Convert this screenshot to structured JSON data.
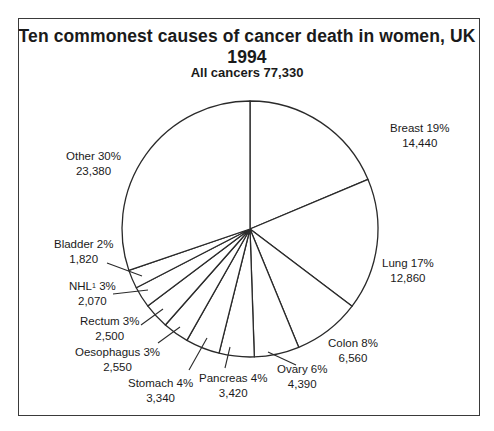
{
  "chart_data": {
    "type": "pie",
    "title": "Ten commonest causes of cancer death in women, UK 1994",
    "subtitle": "All cancers 77,330",
    "total": 77330,
    "start_angle": "12 o'clock",
    "direction": "clockwise",
    "slices": [
      {
        "name": "Breast",
        "percent": 19,
        "value": 14440,
        "label": "Breast 19%",
        "value_label": "14,440"
      },
      {
        "name": "Lung",
        "percent": 17,
        "value": 12860,
        "label": "Lung 17%",
        "value_label": "12,860"
      },
      {
        "name": "Colon",
        "percent": 8,
        "value": 6560,
        "label": "Colon 8%",
        "value_label": "6,560"
      },
      {
        "name": "Ovary",
        "percent": 6,
        "value": 4390,
        "label": "Ovary 6%",
        "value_label": "4,390"
      },
      {
        "name": "Pancreas",
        "percent": 4,
        "value": 3420,
        "label": "Pancreas 4%",
        "value_label": "3,420"
      },
      {
        "name": "Stomach",
        "percent": 4,
        "value": 3340,
        "label": "Stomach 4%",
        "value_label": "3,340"
      },
      {
        "name": "Oesophagus",
        "percent": 3,
        "value": 2550,
        "label": "Oesophagus 3%",
        "value_label": "2,550"
      },
      {
        "name": "Rectum",
        "percent": 3,
        "value": 2500,
        "label": "Rectum 3%",
        "value_label": "2,500"
      },
      {
        "name": "NHL",
        "footnote": "1",
        "percent": 3,
        "value": 2070,
        "label": "NHL",
        "label_pct": "3%",
        "value_label": "2,070"
      },
      {
        "name": "Bladder",
        "percent": 2,
        "value": 1820,
        "label": "Bladder 2%",
        "value_label": "1,820"
      },
      {
        "name": "Other",
        "percent": 30,
        "value": 23380,
        "label": "Other 30%",
        "value_label": "23,380"
      }
    ],
    "colors": {
      "fill": "#ffffff",
      "stroke": "#2a2a2a"
    }
  }
}
